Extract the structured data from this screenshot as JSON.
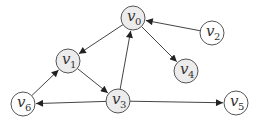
{
  "diagram": {
    "type": "directed-graph",
    "colors": {
      "edge": "#444444",
      "node_stroke": "#555555",
      "node_fill_shaded": "#ececec",
      "node_fill_plain": "#ffffff"
    },
    "nodes": [
      {
        "id": "v0",
        "label": "v",
        "sub": "0",
        "x": 133,
        "y": 18,
        "shaded": true
      },
      {
        "id": "v1",
        "label": "v",
        "sub": "1",
        "x": 68,
        "y": 61,
        "shaded": true
      },
      {
        "id": "v2",
        "label": "v",
        "sub": "2",
        "x": 212,
        "y": 33,
        "shaded": false
      },
      {
        "id": "v3",
        "label": "v",
        "sub": "3",
        "x": 118,
        "y": 101,
        "shaded": true
      },
      {
        "id": "v4",
        "label": "v",
        "sub": "4",
        "x": 186,
        "y": 71,
        "shaded": true
      },
      {
        "id": "v5",
        "label": "v",
        "sub": "5",
        "x": 236,
        "y": 103,
        "shaded": false
      },
      {
        "id": "v6",
        "label": "v",
        "sub": "6",
        "x": 23,
        "y": 104,
        "shaded": false
      }
    ],
    "edges": [
      {
        "from": "v0",
        "to": "v1"
      },
      {
        "from": "v0",
        "to": "v4"
      },
      {
        "from": "v2",
        "to": "v0"
      },
      {
        "from": "v1",
        "to": "v3"
      },
      {
        "from": "v3",
        "to": "v0"
      },
      {
        "from": "v3",
        "to": "v6"
      },
      {
        "from": "v3",
        "to": "v5"
      },
      {
        "from": "v6",
        "to": "v1"
      }
    ]
  }
}
